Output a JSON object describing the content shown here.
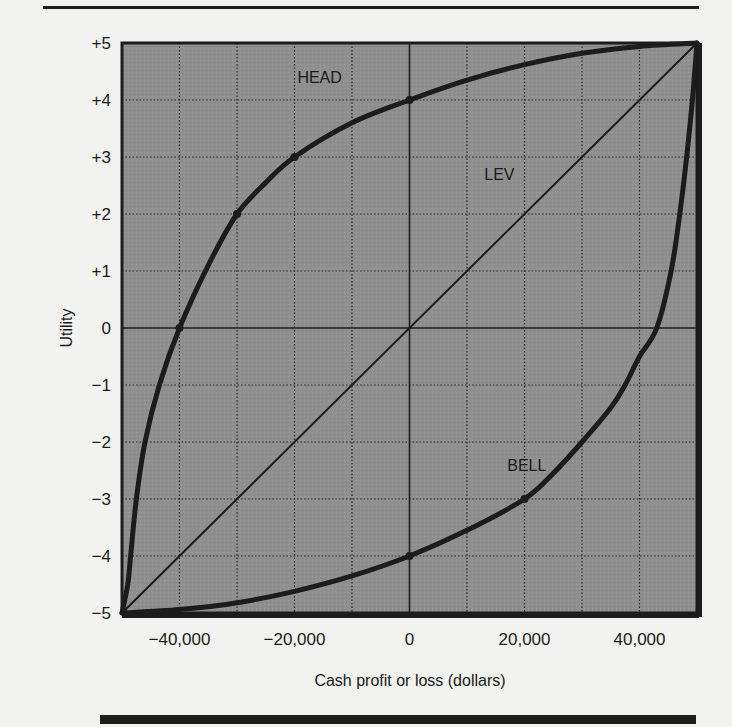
{
  "chart_data": {
    "type": "line",
    "title": "",
    "xlabel": "Cash profit or loss (dollars)",
    "ylabel": "Utility",
    "xlim": [
      -50000,
      50000
    ],
    "ylim": [
      -5,
      5
    ],
    "grid": true,
    "legend": "inline labels",
    "x_ticks": [
      {
        "value": -40000,
        "label": "−40,000"
      },
      {
        "value": -20000,
        "label": "−20,000"
      },
      {
        "value": 0,
        "label": "0"
      },
      {
        "value": 20000,
        "label": "20,000"
      },
      {
        "value": 40000,
        "label": "40,000"
      }
    ],
    "y_ticks": [
      {
        "value": 5,
        "label": "+5"
      },
      {
        "value": 4,
        "label": "+4"
      },
      {
        "value": 3,
        "label": "+3"
      },
      {
        "value": 2,
        "label": "+2"
      },
      {
        "value": 1,
        "label": "+1"
      },
      {
        "value": 0,
        "label": "0"
      },
      {
        "value": -1,
        "label": "−1"
      },
      {
        "value": -2,
        "label": "−2"
      },
      {
        "value": -3,
        "label": "−3"
      },
      {
        "value": -4,
        "label": "−4"
      },
      {
        "value": -5,
        "label": "−5"
      }
    ],
    "series": [
      {
        "name": "HEAD",
        "label_pos": {
          "x": -19500,
          "y": 4.3
        },
        "stroke_width": 5,
        "points": [
          [
            -50000,
            -5
          ],
          [
            -49000,
            -4.5
          ],
          [
            -48500,
            -4
          ],
          [
            -47500,
            -3
          ],
          [
            -46000,
            -2
          ],
          [
            -43500,
            -1
          ],
          [
            -40000,
            0
          ],
          [
            -35000,
            1.1
          ],
          [
            -30000,
            2
          ],
          [
            -25000,
            2.55
          ],
          [
            -20000,
            3
          ],
          [
            -10000,
            3.6
          ],
          [
            0,
            4
          ],
          [
            10000,
            4.35
          ],
          [
            20000,
            4.62
          ],
          [
            30000,
            4.82
          ],
          [
            40000,
            4.94
          ],
          [
            50000,
            5
          ]
        ],
        "markers": [
          [
            -40000,
            0
          ],
          [
            -30000,
            2
          ],
          [
            -20000,
            3
          ],
          [
            0,
            4
          ]
        ]
      },
      {
        "name": "LEV",
        "label_pos": {
          "x": 13000,
          "y": 2.6
        },
        "stroke_width": 2,
        "points": [
          [
            -50000,
            -5
          ],
          [
            50000,
            5
          ]
        ],
        "markers": []
      },
      {
        "name": "BELL",
        "label_pos": {
          "x": 17000,
          "y": -2.5
        },
        "stroke_width": 5,
        "points": [
          [
            -50000,
            -5
          ],
          [
            -40000,
            -4.94
          ],
          [
            -30000,
            -4.82
          ],
          [
            -20000,
            -4.62
          ],
          [
            -10000,
            -4.35
          ],
          [
            0,
            -4
          ],
          [
            10000,
            -3.55
          ],
          [
            20000,
            -3
          ],
          [
            25000,
            -2.55
          ],
          [
            30000,
            -2
          ],
          [
            35000,
            -1.4
          ],
          [
            37500,
            -1
          ],
          [
            40000,
            -0.5
          ],
          [
            43000,
            0
          ],
          [
            45500,
            1
          ],
          [
            47000,
            2
          ],
          [
            48200,
            3
          ],
          [
            49200,
            4
          ],
          [
            50000,
            5
          ]
        ],
        "markers": [
          [
            0,
            -4
          ],
          [
            20000,
            -3
          ]
        ]
      }
    ]
  },
  "colors": {
    "plot_background": "#8f8f8f",
    "grid": "#2a2a2a",
    "curve": "#1c1c1c",
    "page": "#f2f2f0"
  }
}
